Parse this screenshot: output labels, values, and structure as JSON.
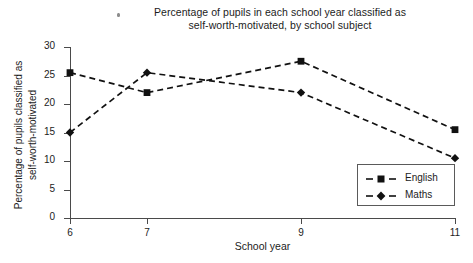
{
  "title": {
    "line1": "Percentage of pupils in each school year classified as",
    "line2": "self-worth-motivated, by school subject"
  },
  "ylabel": {
    "line1": "Percentage of pupils classified as",
    "line2": "self-worth-motivated"
  },
  "xlabel": "School year",
  "legend": {
    "english": "English",
    "maths": "Maths"
  },
  "chart_data": {
    "type": "line",
    "title": "Percentage of pupils in each school year classified as self-worth-motivated, by school subject",
    "xlabel": "School year",
    "ylabel": "Percentage of pupils classified as self-worth-motivated",
    "x": [
      6,
      7,
      9,
      11
    ],
    "xtick_labels": [
      "6",
      "7",
      "9",
      "11"
    ],
    "ytick_labels": [
      "0",
      "5",
      "10",
      "15",
      "20",
      "25",
      "30"
    ],
    "yticks": [
      0,
      5,
      10,
      15,
      20,
      25,
      30
    ],
    "xlim": [
      6,
      11
    ],
    "ylim": [
      0,
      30
    ],
    "grid": false,
    "legend_position": "bottom-right",
    "line_style": "dashed",
    "series": [
      {
        "name": "English",
        "marker": "square",
        "color": "#111111",
        "values": [
          25.5,
          22.0,
          27.5,
          15.5
        ]
      },
      {
        "name": "Maths",
        "marker": "diamond",
        "color": "#111111",
        "values": [
          15.0,
          25.5,
          22.0,
          10.5
        ]
      }
    ]
  }
}
